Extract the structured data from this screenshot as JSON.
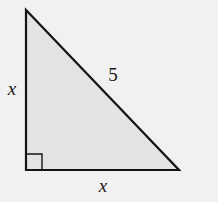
{
  "diagram": {
    "type": "right-triangle",
    "colors": {
      "background": "#f1f1f1",
      "fill": "#e3e3e3",
      "stroke": "#141414"
    },
    "vertices": {
      "top": [
        26,
        10
      ],
      "right_angle": [
        26,
        170
      ],
      "right": [
        179,
        170
      ]
    },
    "right_angle_marker_size": 16,
    "labels": {
      "left_leg": "x",
      "bottom_leg": "x",
      "hypotenuse": "5"
    }
  }
}
